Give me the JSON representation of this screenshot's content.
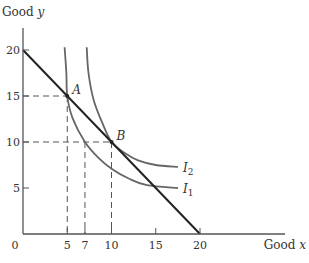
{
  "chart_data": {
    "type": "line",
    "title": "",
    "xlabel": "Good",
    "xlabel_var": "x",
    "ylabel": "Good",
    "ylabel_var": "y",
    "xlim": [
      0,
      24
    ],
    "ylim": [
      0,
      22
    ],
    "grid": false,
    "origin_label": "0",
    "x_ticks": [
      5,
      7,
      10,
      15,
      20
    ],
    "y_ticks": [
      5,
      10,
      15,
      20
    ],
    "budget_line": {
      "name": "Budget line",
      "points": [
        [
          0,
          20
        ],
        [
          20,
          0
        ]
      ],
      "color": "#222222"
    },
    "series": [
      {
        "name": "I",
        "subscript": "1",
        "color": "#666666",
        "points": [
          [
            4.7,
            20.3
          ],
          [
            4.9,
            17.5
          ],
          [
            5,
            15
          ],
          [
            5.6,
            12.6
          ],
          [
            7,
            10
          ],
          [
            8.5,
            8.3
          ],
          [
            10,
            7.1
          ],
          [
            12,
            6
          ],
          [
            14,
            5.3
          ],
          [
            17.5,
            5
          ]
        ]
      },
      {
        "name": "I",
        "subscript": "2",
        "color": "#666666",
        "points": [
          [
            7.2,
            20.3
          ],
          [
            7.4,
            17.5
          ],
          [
            8,
            14.5
          ],
          [
            9,
            12
          ],
          [
            10,
            10
          ],
          [
            11.5,
            8.8
          ],
          [
            13,
            8
          ],
          [
            15,
            7.5
          ],
          [
            17.5,
            7.3
          ]
        ]
      }
    ],
    "annotations": [
      {
        "label": "A",
        "point": [
          5,
          15
        ],
        "dashed_guides": true
      },
      {
        "label": "B",
        "point": [
          10,
          10
        ],
        "dashed_guides": true
      },
      {
        "label": "",
        "point": [
          7,
          10
        ],
        "dashed_guides": "vertical"
      }
    ]
  }
}
